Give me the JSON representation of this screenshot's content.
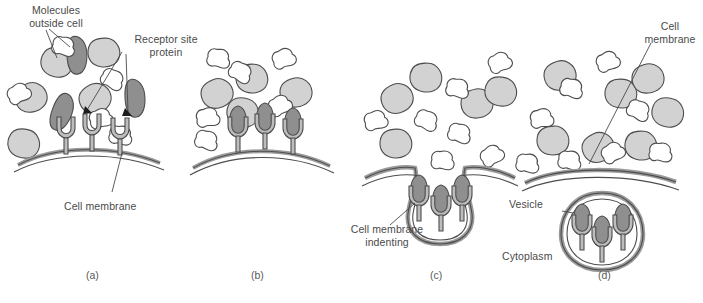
{
  "figure": {
    "panel_count": 4,
    "background_color": "#ffffff",
    "outline_color": "#4d4d4d",
    "molecule_light_color": "#d2d2d2",
    "molecule_dark_color": "#8f8f8f",
    "molecule_white_color": "#ffffff",
    "membrane_color": "#9a9a9a",
    "text_color": "#4a4a4a"
  },
  "labels": {
    "molecules_outside_cell": "Molecules\noutside cell",
    "receptor_site_protein": "Receptor site\nprotein",
    "cell_membrane_a": "Cell membrane",
    "cell_membrane_indenting": "Cell membrane\nindenting",
    "cell_membrane_d": "Cell\nmembrane",
    "vesicle": "Vesicle",
    "cytoplasm": "Cytoplasm"
  },
  "panels": [
    {
      "id": "a",
      "letter": "(a)",
      "caption": "Molecules approach receptor sites on the cell membrane",
      "receptor_count": 3,
      "membrane_state": "flat-curved",
      "bound_molecules": 0
    },
    {
      "id": "b",
      "letter": "(b)",
      "caption": "Molecules bind to the receptor site proteins",
      "receptor_count": 3,
      "membrane_state": "flat-curved",
      "bound_molecules": 3
    },
    {
      "id": "c",
      "letter": "(c)",
      "caption": "Cell membrane indents around the bound receptors",
      "receptor_count": 3,
      "membrane_state": "indenting",
      "bound_molecules": 3
    },
    {
      "id": "d",
      "letter": "(d)",
      "caption": "Vesicle pinches off into the cytoplasm",
      "receptor_count": 3,
      "membrane_state": "vesicle-formed",
      "bound_molecules": 3
    }
  ]
}
